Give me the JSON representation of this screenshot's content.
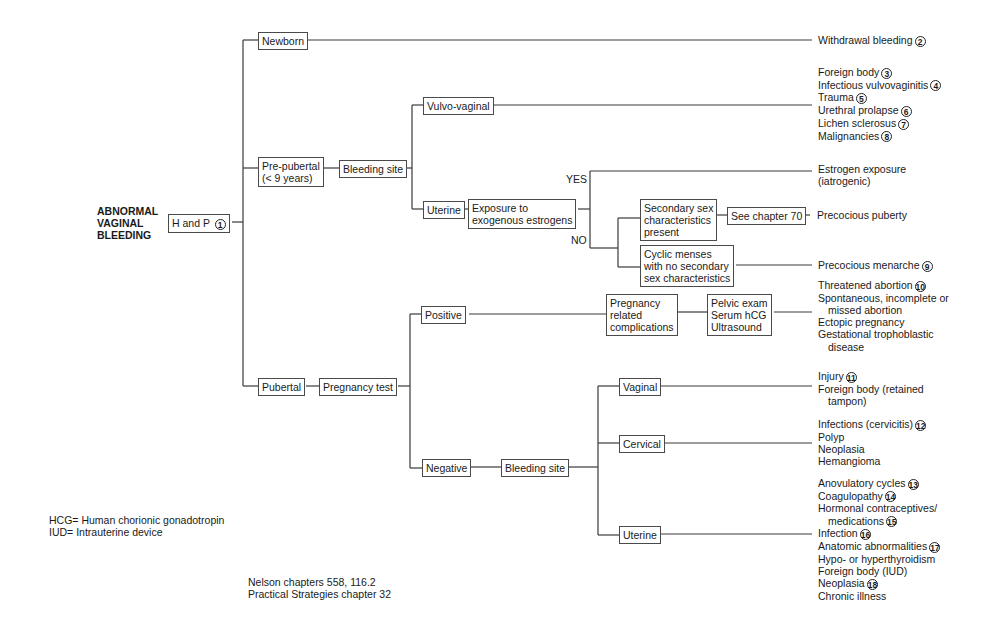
{
  "title": [
    "ABNORMAL",
    "VAGINAL",
    "BLEEDING"
  ],
  "nodes": {
    "h_and_p": {
      "label": "H and P",
      "num": "1"
    },
    "newborn": "Newborn",
    "prepubertal": [
      "Pre-pubertal",
      "(< 9 years)"
    ],
    "pubertal": "Pubertal",
    "bleeding_site_pre": "Bleeding site",
    "vulvo_vaginal": "Vulvo-vaginal",
    "uterine_pre": "Uterine",
    "exposure": [
      "Exposure to",
      "exogenous estrogens"
    ],
    "yes": "YES",
    "no": "NO",
    "secondary_sex": [
      "Secondary sex",
      "characteristics",
      "present"
    ],
    "see_chapter": "See chapter 70",
    "cyclic_menses": [
      "Cyclic menses",
      "with no secondary",
      "sex characteristics"
    ],
    "pregnancy_test": "Pregnancy test",
    "positive": "Positive",
    "negative": "Negative",
    "pregnancy_complications": [
      "Pregnancy",
      "related",
      "complications"
    ],
    "pelvic_exam": [
      "Pelvic exam",
      "Serum hCG",
      "Ultrasound"
    ],
    "bleeding_site_pub": "Bleeding site",
    "vaginal": "Vaginal",
    "cervical": "Cervical",
    "uterine_pub": "Uterine"
  },
  "outcomes": {
    "newborn": [
      {
        "text": "Withdrawal bleeding",
        "num": "2"
      }
    ],
    "vulvo_vaginal": [
      {
        "text": "Foreign body",
        "num": "3"
      },
      {
        "text": "Infectious vulvovaginitis",
        "num": "4"
      },
      {
        "text": "Trauma",
        "num": "5"
      },
      {
        "text": "Urethral prolapse",
        "num": "6"
      },
      {
        "text": "Lichen sclerosus",
        "num": "7"
      },
      {
        "text": "Malignancies",
        "num": "8"
      }
    ],
    "estrogen": [
      {
        "text": "Estrogen exposure"
      },
      {
        "text": "(iatrogenic)"
      }
    ],
    "precocious_puberty": [
      {
        "text": "Precocious puberty"
      }
    ],
    "precocious_menarche": [
      {
        "text": "Precocious menarche",
        "num": "9"
      }
    ],
    "pregnancy": [
      {
        "text": "Threatened abortion",
        "num": "10"
      },
      {
        "text": "Spontaneous, incomplete or"
      },
      {
        "text": "missed abortion",
        "indent": true
      },
      {
        "text": "Ectopic pregnancy"
      },
      {
        "text": "Gestational trophoblastic"
      },
      {
        "text": "disease",
        "indent": true
      }
    ],
    "vaginal": [
      {
        "text": "Injury",
        "num": "11"
      },
      {
        "text": "Foreign body (retained"
      },
      {
        "text": "tampon)",
        "indent": true
      }
    ],
    "cervical": [
      {
        "text": "Infections (cervicitis)",
        "num": "12"
      },
      {
        "text": "Polyp"
      },
      {
        "text": "Neoplasia"
      },
      {
        "text": "Hemangioma"
      }
    ],
    "uterine": [
      {
        "text": "Anovulatory cycles",
        "num": "13"
      },
      {
        "text": "Coagulopathy",
        "num": "14"
      },
      {
        "text": "Hormonal contraceptives/"
      },
      {
        "text": "medications",
        "num": "15",
        "indent": true
      },
      {
        "text": "Infection",
        "num": "16"
      },
      {
        "text": "Anatomic abnormalities",
        "num": "17"
      },
      {
        "text": "Hypo- or hyperthyroidism"
      },
      {
        "text": "Foreign body (IUD)"
      },
      {
        "text": "Neoplasia",
        "num": "18"
      },
      {
        "text": "Chronic illness"
      }
    ]
  },
  "legend": [
    "HCG= Human chorionic gonadotropin",
    "IUD= Intrauterine device"
  ],
  "references": [
    "Nelson chapters 558, 116.2",
    "Practical Strategies chapter 32"
  ],
  "colors": {
    "line": "#3a3a3a",
    "border": "#4a4a4a",
    "text": "#1a1a1a"
  }
}
